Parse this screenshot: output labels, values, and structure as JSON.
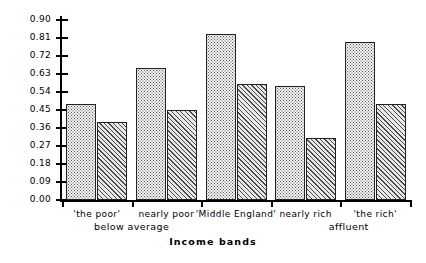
{
  "chart_data": {
    "type": "bar",
    "title": "",
    "xlabel": "Income bands",
    "ylabel": "",
    "ylim": [
      0.0,
      0.9
    ],
    "grid": false,
    "legend": "none",
    "categories": [
      "'the poor'",
      "nearly poor",
      "'Middle England'",
      "nearly rich",
      "'the rich'"
    ],
    "group_labels": [
      "below average",
      "affluent"
    ],
    "y_ticks": [
      "0.00",
      "0.09",
      "0.18",
      "0.27",
      "0.36",
      "0.45",
      "0.54",
      "0.63",
      "0.72",
      "0.81",
      "0.90"
    ],
    "y_tick_values": [
      0.0,
      0.09,
      0.18,
      0.27,
      0.36,
      0.45,
      0.54,
      0.63,
      0.72,
      0.81,
      0.9
    ],
    "series": [
      {
        "name": "series-a",
        "pattern": "dotted",
        "values": [
          0.48,
          0.66,
          0.83,
          0.57,
          0.79
        ]
      },
      {
        "name": "series-b",
        "pattern": "hatched",
        "values": [
          0.39,
          0.45,
          0.58,
          0.31,
          0.48
        ]
      }
    ],
    "bars": [
      {
        "label": "'the poor'",
        "series": "series-a",
        "pattern": "dotted",
        "value": 0.48
      },
      {
        "label": "'the poor'",
        "series": "series-b",
        "pattern": "hatched",
        "value": 0.39
      },
      {
        "label": "nearly poor",
        "series": "series-a",
        "pattern": "dotted",
        "value": 0.66
      },
      {
        "label": "nearly poor",
        "series": "series-b",
        "pattern": "hatched",
        "value": 0.45
      },
      {
        "label": "'Middle England'",
        "series": "series-a",
        "pattern": "dotted",
        "value": 0.83
      },
      {
        "label": "'Middle England'",
        "series": "series-b",
        "pattern": "hatched",
        "value": 0.58
      },
      {
        "label": "nearly rich",
        "series": "series-a",
        "pattern": "dotted",
        "value": 0.57
      },
      {
        "label": "nearly rich",
        "series": "series-b",
        "pattern": "hatched",
        "value": 0.31
      },
      {
        "label": "'the rich'",
        "series": "series-a",
        "pattern": "dotted",
        "value": 0.79
      },
      {
        "label": "'the rich'",
        "series": "series-b",
        "pattern": "hatched",
        "value": 0.48
      }
    ],
    "colors": {
      "axis": "#000000",
      "bar_outline": "#222222",
      "dotted_fill": "#f2f2f2",
      "hatched_fill": "#e8e8e8",
      "background": "#ffffff"
    }
  }
}
